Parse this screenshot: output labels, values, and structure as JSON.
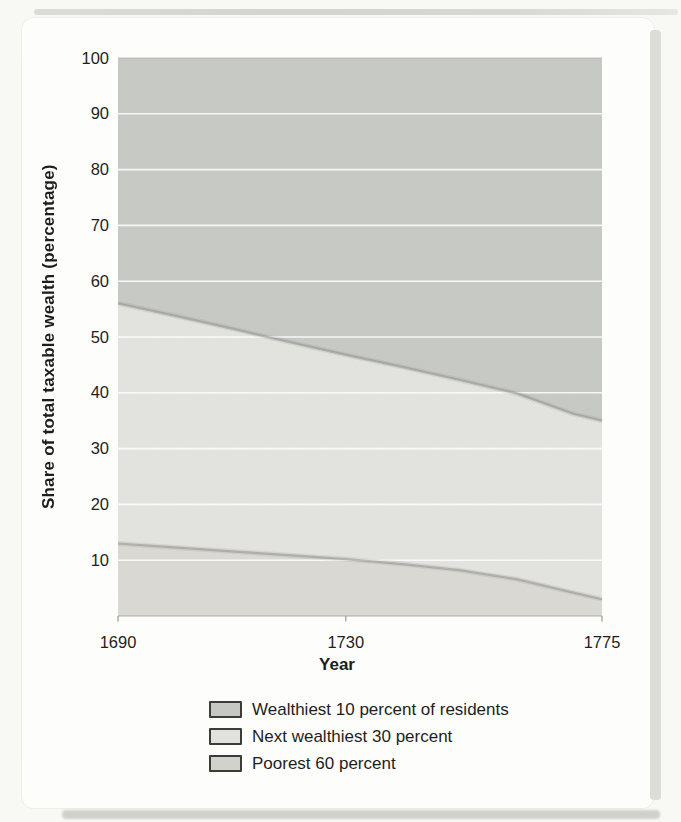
{
  "figure_type": "scanned textbook stacked area chart",
  "chart_data": {
    "type": "area",
    "stacked": true,
    "title": "",
    "xlabel": "Year",
    "ylabel": "Share of total taxable wealth (percentage)",
    "xlim": [
      1690,
      1775
    ],
    "ylim": [
      0,
      100
    ],
    "x_ticks": [
      1690,
      1730,
      1775
    ],
    "y_ticks": [
      10,
      20,
      30,
      40,
      50,
      60,
      70,
      80,
      90,
      100
    ],
    "grid": "horizontal white gridlines every 10",
    "legend_position": "bottom-center",
    "x": [
      1690,
      1700,
      1710,
      1720,
      1730,
      1740,
      1750,
      1760,
      1770,
      1775
    ],
    "series": [
      {
        "name": "Poorest 60 percent",
        "color": "#dbdad5",
        "values": [
          13,
          12.3,
          11.6,
          10.9,
          10.2,
          9.3,
          8.2,
          6.6,
          4.2,
          3
        ],
        "cumulative_top": [
          13,
          12.3,
          11.6,
          10.9,
          10.2,
          9.3,
          8.2,
          6.6,
          4.2,
          3
        ]
      },
      {
        "name": "Next wealthiest 30 percent",
        "color": "#e4e4e0",
        "values": [
          43,
          41.5,
          39.9,
          38.2,
          36.6,
          35.3,
          34.1,
          33.3,
          32,
          32
        ],
        "cumulative_top": [
          56,
          53.8,
          51.5,
          49.1,
          46.8,
          44.6,
          42.3,
          39.9,
          36.2,
          35
        ]
      },
      {
        "name": "Wealthiest 10 percent of residents",
        "color": "#c8cac6",
        "values": [
          44,
          46.2,
          48.5,
          50.9,
          53.2,
          55.4,
          57.7,
          60.1,
          63.8,
          65
        ],
        "cumulative_top": [
          100,
          100,
          100,
          100,
          100,
          100,
          100,
          100,
          100,
          100
        ]
      }
    ]
  },
  "legend": {
    "items": [
      {
        "label": "Wealthiest 10 percent of residents",
        "color": "#c6c8c4"
      },
      {
        "label": "Next wealthiest 30 percent",
        "color": "#e1e1dd"
      },
      {
        "label": "Poorest 60 percent",
        "color": "#d2d2cd"
      }
    ]
  },
  "colors": {
    "gridline": "#ffffff",
    "boundary_line": "#83837e",
    "axis_text": "#1f1f1d",
    "card_background": "#fdfdfb",
    "page_background": "#f8f8f5"
  }
}
